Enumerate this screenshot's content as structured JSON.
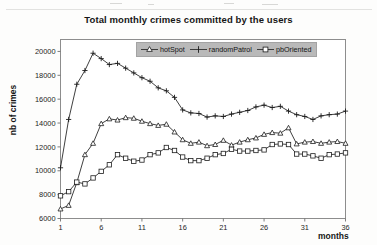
{
  "chart_data": {
    "type": "line",
    "title": "Total monthly crimes committed by the users",
    "xlabel": "months",
    "ylabel": "nb of crimes",
    "xlim": [
      1,
      36
    ],
    "ylim": [
      6000,
      21000
    ],
    "xticks": [
      1,
      6,
      11,
      16,
      21,
      26,
      31,
      36
    ],
    "yticks": [
      6000,
      8000,
      10000,
      12000,
      14000,
      16000,
      18000,
      20000
    ],
    "grid": false,
    "legend_position": "top-center-inside",
    "x": [
      1,
      2,
      3,
      4,
      5,
      6,
      7,
      8,
      9,
      10,
      11,
      12,
      13,
      14,
      15,
      16,
      17,
      18,
      19,
      20,
      21,
      22,
      23,
      24,
      25,
      26,
      27,
      28,
      29,
      30,
      31,
      32,
      33,
      34,
      35,
      36
    ],
    "series": [
      {
        "name": "hotSpot",
        "marker": "triangle",
        "values": [
          6800,
          7100,
          9000,
          11350,
          12300,
          13950,
          14350,
          14250,
          14450,
          14400,
          14150,
          13950,
          13800,
          13900,
          13250,
          12600,
          12300,
          12400,
          12100,
          12200,
          12550,
          12150,
          12400,
          12600,
          12750,
          13050,
          13200,
          13150,
          13600,
          12250,
          12400,
          12450,
          12300,
          12400,
          12450,
          12300
        ]
      },
      {
        "name": "randomPatrol",
        "marker": "plus",
        "values": [
          10250,
          14300,
          17250,
          18400,
          19850,
          19400,
          18900,
          19000,
          18600,
          18200,
          17800,
          17500,
          16950,
          16700,
          16150,
          15100,
          14850,
          14800,
          14500,
          14600,
          14550,
          14750,
          14900,
          15050,
          15350,
          15500,
          15300,
          15400,
          15000,
          14700,
          14550,
          14300,
          14600,
          14700,
          14750,
          15000
        ]
      },
      {
        "name": "pbOriented",
        "marker": "square",
        "values": [
          7900,
          8250,
          9050,
          8900,
          9400,
          9950,
          10500,
          11350,
          11050,
          10800,
          10900,
          11350,
          11500,
          11950,
          11700,
          11150,
          10850,
          10850,
          11050,
          11350,
          11450,
          11800,
          11650,
          11650,
          11700,
          11750,
          12200,
          12250,
          12200,
          11400,
          11400,
          11250,
          11050,
          11350,
          11400,
          11500
        ]
      }
    ]
  }
}
